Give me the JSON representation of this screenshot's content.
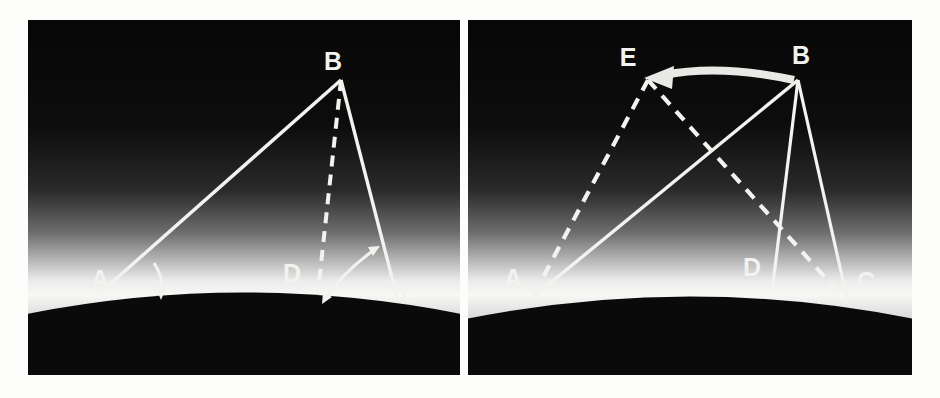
{
  "figure": {
    "background_color": "#fdfdfb",
    "panel_background": "#0a0a0a",
    "line_color": "#f2f2ee",
    "glow_color": "#ffffff",
    "ground_color": "#090909",
    "panel_count": 2
  },
  "panels": [
    {
      "id": "left-panel",
      "name": "left-diagram",
      "labels": [
        {
          "text": "A",
          "x": 72,
          "y": 268
        },
        {
          "text": "B",
          "x": 305,
          "y": 50
        },
        {
          "text": "C",
          "x": 372,
          "y": 278
        },
        {
          "text": "D",
          "x": 264,
          "y": 258
        }
      ],
      "points": {
        "A": {
          "x": 72,
          "y": 273
        },
        "B": {
          "x": 313,
          "y": 60
        },
        "C": {
          "x": 370,
          "y": 281
        },
        "D": {
          "x": 290,
          "y": 270
        }
      },
      "solid_lines": [
        {
          "name": "line-A-B",
          "from": "A",
          "to": "B"
        },
        {
          "name": "line-B-C",
          "from": "B",
          "to": "C"
        }
      ],
      "dashed_lines": [
        {
          "name": "line-B-D",
          "from": "B",
          "to": "D"
        }
      ],
      "angle_arcs": [
        {
          "name": "angle-arrow-at-A",
          "style": "single-headed-curved"
        },
        {
          "name": "angle-arrow-at-C",
          "style": "double-headed-curved"
        }
      ]
    },
    {
      "id": "right-panel",
      "name": "right-diagram",
      "labels": [
        {
          "text": "A",
          "x": 45,
          "y": 263
        },
        {
          "text": "B",
          "x": 328,
          "y": 45
        },
        {
          "text": "C",
          "x": 397,
          "y": 265
        },
        {
          "text": "D",
          "x": 284,
          "y": 252
        },
        {
          "text": "E",
          "x": 159,
          "y": 48
        }
      ],
      "points": {
        "A": {
          "x": 64,
          "y": 275
        },
        "B": {
          "x": 330,
          "y": 60
        },
        "C": {
          "x": 380,
          "y": 280
        },
        "D": {
          "x": 304,
          "y": 268
        },
        "E": {
          "x": 180,
          "y": 58
        }
      },
      "solid_lines": [
        {
          "name": "line-A-B",
          "from": "A",
          "to": "B"
        },
        {
          "name": "line-B-D",
          "from": "B",
          "to": "D"
        },
        {
          "name": "line-B-C",
          "from": "B",
          "to": "C"
        }
      ],
      "dashed_lines": [
        {
          "name": "line-E-A",
          "from": "E",
          "to": "A"
        },
        {
          "name": "line-E-C",
          "from": "E",
          "to": "C"
        }
      ],
      "motion_arrow": {
        "name": "arrow-B-to-E",
        "from": "B",
        "to": "E",
        "direction": "leftward",
        "style": "thick-curved"
      }
    }
  ]
}
